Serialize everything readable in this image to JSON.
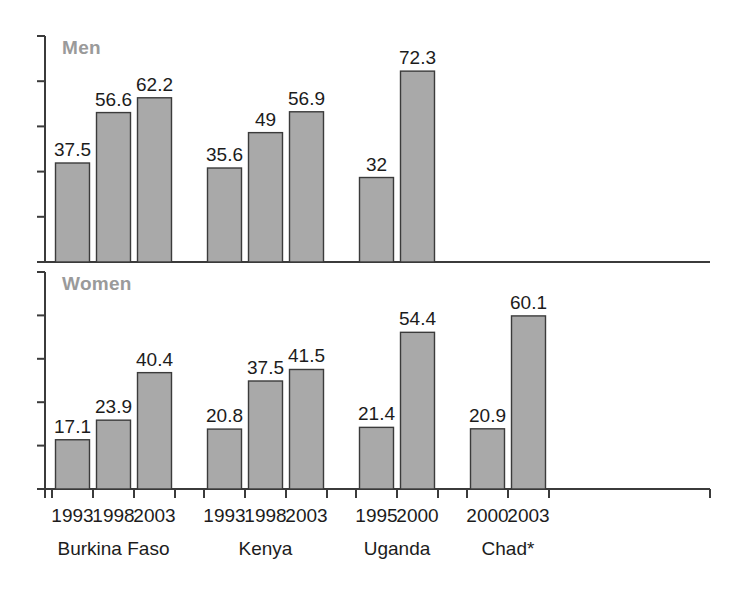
{
  "chart_data": {
    "type": "bar",
    "title": "",
    "subtitle": "",
    "xlabel": "",
    "ylabel": "",
    "grid": false,
    "legend_position": "none",
    "panels": [
      {
        "name": "men",
        "label": "Men",
        "ylim": [
          0,
          80
        ],
        "groups": [
          {
            "country": "Burkina Faso",
            "categories": [
              "1993",
              "1998",
              "2003"
            ],
            "values": [
              37.5,
              56.6,
              62.2
            ]
          },
          {
            "country": "Kenya",
            "categories": [
              "1993",
              "1998",
              "2003"
            ],
            "values": [
              35.6,
              49,
              56.9
            ]
          },
          {
            "country": "Uganda",
            "categories": [
              "1995",
              "2000"
            ],
            "values": [
              32,
              72.3
            ]
          },
          {
            "country": "Chad*",
            "categories": [
              "2000",
              "2003"
            ],
            "values": [
              null,
              null
            ]
          }
        ]
      },
      {
        "name": "women",
        "label": "Women",
        "ylim": [
          0,
          70
        ],
        "groups": [
          {
            "country": "Burkina Faso",
            "categories": [
              "1993",
              "1998",
              "2003"
            ],
            "values": [
              17.1,
              23.9,
              40.4
            ]
          },
          {
            "country": "Kenya",
            "categories": [
              "1993",
              "1998",
              "2003"
            ],
            "values": [
              20.8,
              37.5,
              41.5
            ]
          },
          {
            "country": "Uganda",
            "categories": [
              "1995",
              "2000"
            ],
            "values": [
              21.4,
              54.4
            ]
          },
          {
            "country": "Chad*",
            "categories": [
              "2000",
              "2003"
            ],
            "values": [
              20.9,
              60.1
            ]
          }
        ]
      }
    ],
    "axis_categories": [
      {
        "country": "Burkina Faso",
        "years": [
          "1993",
          "1998",
          "2003"
        ]
      },
      {
        "country": "Kenya",
        "years": [
          "1993",
          "1998",
          "2003"
        ]
      },
      {
        "country": "Uganda",
        "years": [
          "1995",
          "2000"
        ]
      },
      {
        "country": "Chad*",
        "years": [
          "2000",
          "2003"
        ]
      }
    ],
    "colors": {
      "bar_fill": "#a9a9a9",
      "bar_stroke": "#3b3b3b",
      "axis": "#3b3b3b",
      "panel_label": "#9a9a9a",
      "value_label": "#1c1c1c",
      "background": "#ffffff"
    }
  }
}
